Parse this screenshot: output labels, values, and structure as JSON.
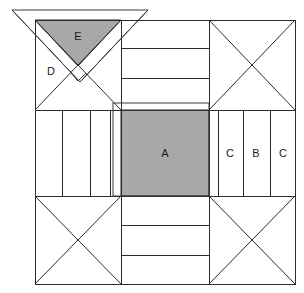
{
  "diagram": {
    "colors": {
      "shaded_patch": "#a8a8a8",
      "background": "#ffffff",
      "line": "#2b2b2b",
      "overlay_line": "#3a3a3a"
    },
    "block": {
      "x": 35,
      "y": 20,
      "width": 260,
      "height": 264
    },
    "labels": [
      {
        "id": "A",
        "text": "A",
        "x": 165,
        "y": 154,
        "patch": "center-square",
        "shaded": true
      },
      {
        "id": "C1",
        "text": "C",
        "x": 230,
        "y": 154,
        "patch": "right-strip-inner",
        "shaded": false
      },
      {
        "id": "B",
        "text": "B",
        "x": 256,
        "y": 154,
        "patch": "right-strip-middle",
        "shaded": false
      },
      {
        "id": "C2",
        "text": "C",
        "x": 283,
        "y": 154,
        "patch": "right-strip-outer",
        "shaded": false
      },
      {
        "id": "D",
        "text": "D",
        "x": 51,
        "y": 72,
        "patch": "corner-triangle-left",
        "shaded": false
      },
      {
        "id": "E",
        "text": "E",
        "x": 78,
        "y": 37,
        "patch": "corner-triangle-top",
        "shaded": true
      }
    ],
    "geometry": {
      "outer": {
        "left": 35,
        "top": 20,
        "right": 295,
        "bottom": 284
      },
      "inner_cross": {
        "left": 121,
        "top": 110,
        "right": 209,
        "bottom": 196
      },
      "center_square": {
        "left": 121,
        "top": 110,
        "right": 209,
        "bottom": 196
      },
      "corner_size": 86,
      "top_strip_lines_y": [
        48,
        78
      ],
      "bottom_strip_lines_y": [
        225,
        255
      ],
      "left_strip_lines_x": [
        62,
        90,
        110
      ],
      "right_strip_lines_x": [
        218,
        243,
        270
      ],
      "overlay_triangle": {
        "apex_x": 80,
        "apex_y": 98,
        "left_x": 12,
        "top_y": 10,
        "right_x": 148
      }
    },
    "legend": {
      "shaded_meaning": "shaded patch",
      "plain_meaning": "background patch"
    }
  }
}
